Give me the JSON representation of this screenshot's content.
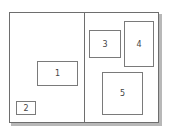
{
  "diagram": {
    "type": "page-layout",
    "pages": [
      {
        "name": "left-page"
      },
      {
        "name": "right-page"
      }
    ],
    "boxes": [
      {
        "label": "1",
        "page": "left",
        "x": 37,
        "y": 61,
        "w": 41,
        "h": 25
      },
      {
        "label": "2",
        "page": "left",
        "x": 16,
        "y": 101,
        "w": 20,
        "h": 14
      },
      {
        "label": "3",
        "page": "right",
        "x": 89,
        "y": 30,
        "w": 32,
        "h": 28
      },
      {
        "label": "4",
        "page": "right",
        "x": 124,
        "y": 21,
        "w": 30,
        "h": 46
      },
      {
        "label": "5",
        "page": "right",
        "x": 102,
        "y": 72,
        "w": 41,
        "h": 43
      }
    ],
    "colors": {
      "border": "#6e6e6e",
      "shadow": "#b8b8b8",
      "background": "#ffffff",
      "text": "#444444"
    }
  }
}
